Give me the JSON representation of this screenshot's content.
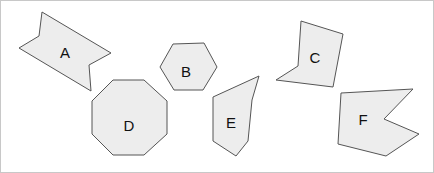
{
  "figure": {
    "title": "",
    "background_color": "#ffffff",
    "border_color": "#c8c8c8",
    "width": 434,
    "height": 173,
    "shape_fill": "#ededed",
    "shape_stroke": "#555555",
    "label_color": "#111111"
  },
  "shapes": [
    {
      "id": "A",
      "label": "A",
      "name": "shape-a-arrow",
      "kind": "concave-arrow",
      "vertex_count": 6,
      "points": "41,11 110,52 88,64 90,90 18,47 38,35",
      "label_x": 64,
      "label_y": 53
    },
    {
      "id": "B",
      "label": "B",
      "name": "shape-b-hexagon",
      "kind": "hexagon",
      "vertex_count": 6,
      "points": "172,43 203,42 216,66 202,89 173,89 159,66",
      "label_x": 185,
      "label_y": 72
    },
    {
      "id": "C",
      "label": "C",
      "name": "shape-c-concave-quad",
      "kind": "concave-quadrilateral",
      "vertex_count": 5,
      "points": "300,20 342,33 332,86 275,79 297,65",
      "label_x": 314,
      "label_y": 58
    },
    {
      "id": "D",
      "label": "D",
      "name": "shape-d-octagon",
      "kind": "octagon",
      "vertex_count": 8,
      "points": "112,79 143,79 166,100 166,133 143,154 112,154 91,133 91,100",
      "label_x": 128,
      "label_y": 126
    },
    {
      "id": "E",
      "label": "E",
      "name": "shape-e-pentagon",
      "kind": "concave-pentagon",
      "vertex_count": 6,
      "points": "258,75 251,99 247,140 235,155 212,140 212,96",
      "label_x": 230,
      "label_y": 123
    },
    {
      "id": "F",
      "label": "F",
      "name": "shape-f-arrow",
      "kind": "concave-arrow",
      "vertex_count": 6,
      "points": "340,92 412,88 383,118 418,133 385,155 337,143",
      "label_x": 362,
      "label_y": 120
    }
  ]
}
